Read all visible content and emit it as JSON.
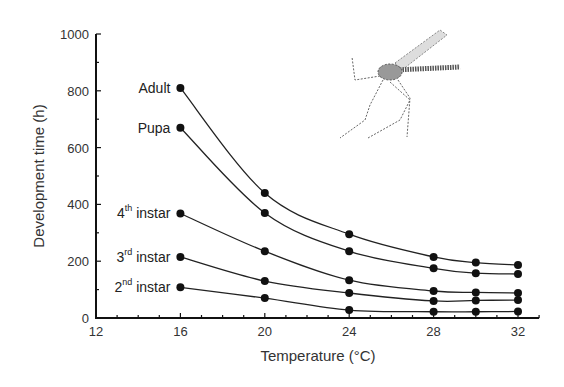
{
  "chart_data": {
    "type": "line",
    "title": "",
    "xlabel": "Temperature (°C)",
    "ylabel": "Development time (h)",
    "xlim": [
      12,
      33
    ],
    "ylim": [
      0,
      1000
    ],
    "x_ticks": [
      12,
      16,
      20,
      24,
      28,
      32
    ],
    "y_ticks": [
      0,
      200,
      400,
      600,
      800,
      1000
    ],
    "grid": false,
    "legend": "inline labels at left of each curve",
    "x": [
      16,
      20,
      24,
      28,
      30,
      32
    ],
    "series": [
      {
        "name": "Adult",
        "label_main": "Adult",
        "label_sup": "",
        "label_rest": "",
        "values": [
          810,
          440,
          295,
          215,
          195,
          187
        ]
      },
      {
        "name": "Pupa",
        "label_main": "Pupa",
        "label_sup": "",
        "label_rest": "",
        "values": [
          670,
          370,
          235,
          175,
          158,
          155
        ]
      },
      {
        "name": "4th instar",
        "label_main": "4",
        "label_sup": "th",
        "label_rest": " instar",
        "values": [
          368,
          235,
          133,
          95,
          90,
          88
        ]
      },
      {
        "name": "3rd instar",
        "label_main": "3",
        "label_sup": "rd",
        "label_rest": " instar",
        "values": [
          215,
          130,
          88,
          60,
          62,
          63
        ]
      },
      {
        "name": "2nd instar",
        "label_main": "2",
        "label_sup": "nd",
        "label_rest": " instar",
        "values": [
          108,
          70,
          28,
          22,
          22,
          23
        ]
      }
    ],
    "annotations": [
      "mosquito illustration (top right)"
    ]
  }
}
